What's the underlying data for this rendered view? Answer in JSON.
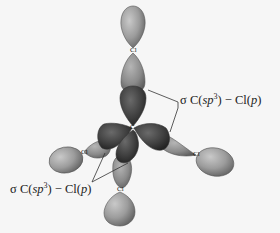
{
  "figure": {
    "central_atom": "C",
    "atoms": [
      {
        "id": "cl-top",
        "label": "Cl"
      },
      {
        "id": "cl-left",
        "label": "Cl"
      },
      {
        "id": "cl-right",
        "label": "Cl"
      },
      {
        "id": "cl-bottom",
        "label": "Cl"
      }
    ],
    "labels": {
      "top_right": {
        "sigma": "σ",
        "c": "C(",
        "sp": "sp",
        "sup": "3",
        "mid": ") − Cl(",
        "p": "p",
        "close": ")"
      },
      "bottom_left": {
        "sigma": "σ",
        "c": "C(",
        "sp": "sp",
        "sup": "3",
        "mid": ") − Cl(",
        "p": "p",
        "close": ")"
      }
    },
    "colors": {
      "background": "#f6f6f6",
      "cl_lobe_light": "#a8a8a8",
      "cl_lobe_dark": "#6e6e6e",
      "c_lobe_light": "#5a5a5a",
      "c_lobe_dark": "#2e2e2e",
      "leader_line": "#333333"
    }
  }
}
